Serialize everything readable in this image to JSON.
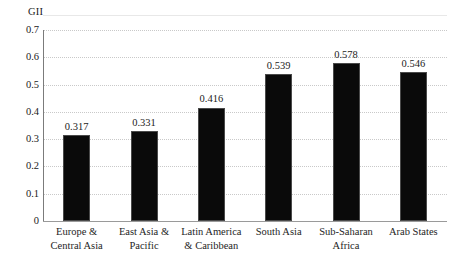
{
  "chart_data": {
    "type": "bar",
    "title": "",
    "ylabel": "GII",
    "xlabel": "",
    "ylim": [
      0,
      0.7
    ],
    "grid": true,
    "legend": "none",
    "categories": [
      "Europe & Central Asia",
      "East Asia & Pacific",
      "Latin America & Caribbean",
      "South Asia",
      "Sub-Saharan Africa",
      "Arab States"
    ],
    "category_lines": [
      [
        "Europe &",
        "Central Asia"
      ],
      [
        "East Asia &",
        "Pacific"
      ],
      [
        "Latin America",
        "& Caribbean"
      ],
      [
        "South Asia",
        ""
      ],
      [
        "Sub-Saharan",
        "Africa"
      ],
      [
        "Arab States",
        ""
      ]
    ],
    "values": [
      0.317,
      0.331,
      0.416,
      0.539,
      0.578,
      0.546
    ],
    "value_labels": [
      "0.317",
      "0.331",
      "0.416",
      "0.539",
      "0.578",
      "0.546"
    ],
    "ytick_values": [
      0.7,
      0.6,
      0.5,
      0.4,
      0.3,
      0.2,
      0.1,
      0
    ],
    "ytick_labels": [
      "0.7",
      "0.6",
      "0.5",
      "0.4",
      "0.3",
      "0.2",
      "0.1",
      "0"
    ],
    "bar_color": "#0a0a0a",
    "grid_color": "#c9c9c9",
    "axis_color": "#7b7b7b",
    "background": "#ffffff"
  }
}
